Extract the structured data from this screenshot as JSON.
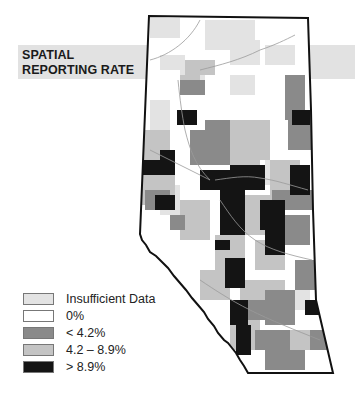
{
  "title": {
    "line1": "SPATIAL",
    "line2": "REPORTING RATE"
  },
  "colors": {
    "insufficient": "#e3e3e3",
    "zero": "#ffffff",
    "low": "#8a8a8a",
    "mid": "#c4c4c4",
    "high": "#141414",
    "border": "#111111",
    "rivers": "#9a9a9a",
    "band": "#e2e2e2"
  },
  "legend": {
    "items": [
      {
        "label": "Insufficient Data",
        "color": "#e3e3e3"
      },
      {
        "label": "0%",
        "color": "#ffffff"
      },
      {
        "label": "< 4.2%",
        "color": "#8a8a8a"
      },
      {
        "label": "4.2 – 8.9%",
        "color": "#c4c4c4"
      },
      {
        "label": "> 8.9%",
        "color": "#141414"
      }
    ]
  }
}
